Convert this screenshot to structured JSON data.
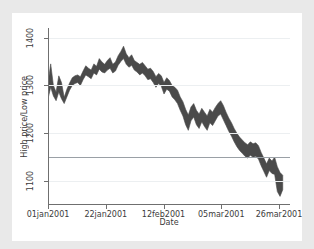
{
  "chart_data": {
    "type": "area",
    "title": "",
    "xlabel": "Date",
    "ylabel": "High price/Low price",
    "grid": true,
    "legend": null,
    "ylim": [
      1050,
      1420
    ],
    "yticks": [
      1100,
      1200,
      1300,
      1400
    ],
    "ytick_labels": [
      "1100",
      "1200",
      "1300",
      "1400"
    ],
    "reference_line_y": 1150,
    "xtick_labels": [
      "01jan2001",
      "22jan2001",
      "12feb2001",
      "05mar2001",
      "26mar2001"
    ],
    "xtick_values": [
      0,
      21,
      42,
      63,
      84
    ],
    "xlim": [
      0,
      88
    ],
    "band_color": "#4a4a4a",
    "series": [
      {
        "name": "High price",
        "values": [
          1305,
          1345,
          1300,
          1286,
          1320,
          1306,
          1275,
          1292,
          1305,
          1316,
          1320,
          1322,
          1318,
          1330,
          1341,
          1336,
          1332,
          1345,
          1340,
          1356,
          1349,
          1344,
          1352,
          1358,
          1344,
          1349,
          1362,
          1371,
          1382,
          1366,
          1358,
          1364,
          1352,
          1348,
          1344,
          1348,
          1341,
          1334,
          1336,
          1329,
          1318,
          1325,
          1320,
          1306,
          1316,
          1310,
          1300,
          1296,
          1290,
          1276,
          1266,
          1250,
          1238,
          1255,
          1262,
          1248,
          1240,
          1252,
          1244,
          1236,
          1250,
          1244,
          1254,
          1262,
          1268,
          1258,
          1244,
          1232,
          1222,
          1210,
          1200,
          1192,
          1186,
          1180,
          1176,
          1182,
          1178,
          1180,
          1174,
          1160,
          1148,
          1136,
          1148,
          1142,
          1150,
          1130,
          1118,
          1112
        ]
      },
      {
        "name": "Low price",
        "values": [
          1272,
          1296,
          1278,
          1268,
          1286,
          1272,
          1262,
          1276,
          1290,
          1300,
          1304,
          1306,
          1300,
          1312,
          1322,
          1318,
          1314,
          1326,
          1322,
          1334,
          1328,
          1326,
          1332,
          1336,
          1326,
          1330,
          1342,
          1350,
          1356,
          1344,
          1338,
          1342,
          1332,
          1328,
          1322,
          1326,
          1320,
          1312,
          1314,
          1306,
          1296,
          1304,
          1298,
          1282,
          1292,
          1288,
          1276,
          1270,
          1262,
          1248,
          1236,
          1218,
          1206,
          1226,
          1234,
          1218,
          1210,
          1224,
          1214,
          1206,
          1222,
          1216,
          1226,
          1236,
          1240,
          1228,
          1216,
          1204,
          1194,
          1182,
          1172,
          1164,
          1158,
          1152,
          1148,
          1154,
          1150,
          1152,
          1146,
          1132,
          1120,
          1108,
          1122,
          1116,
          1114,
          1078,
          1068,
          1082
        ]
      }
    ]
  }
}
